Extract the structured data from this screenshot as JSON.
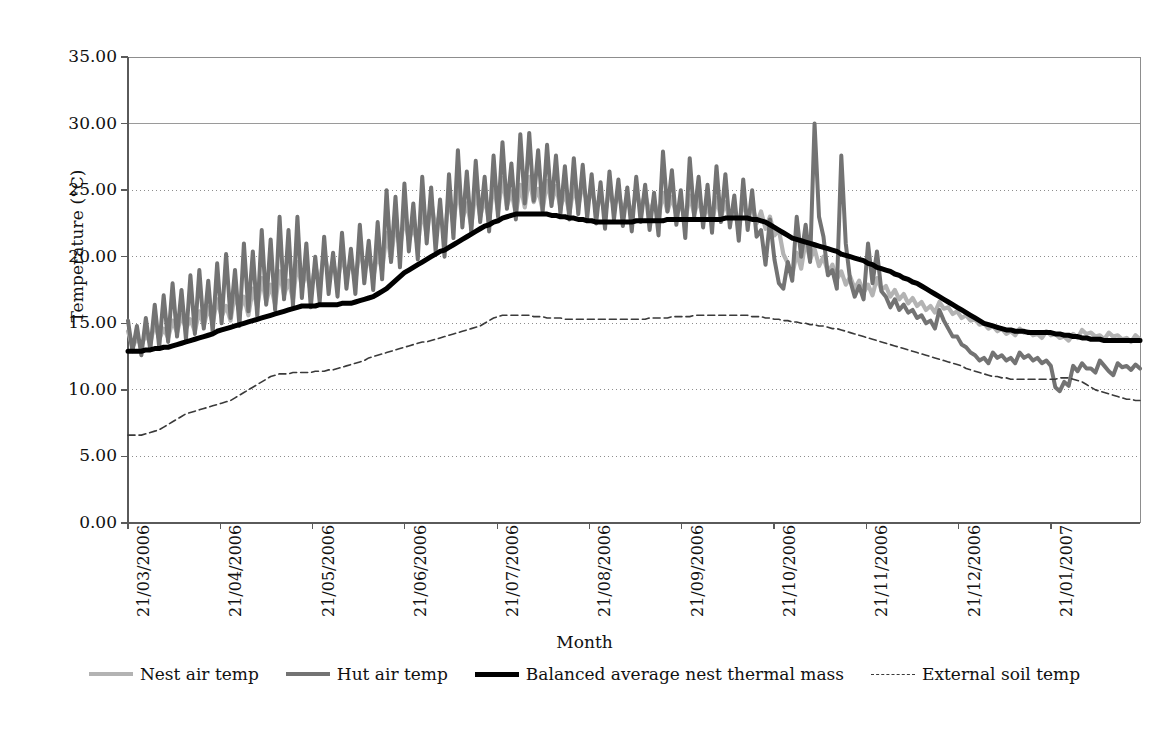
{
  "figure": {
    "cropped_caption_fragment": "",
    "background": "#ffffff"
  },
  "axes": {
    "y_title": "Temperature (°C)",
    "x_title": "Month",
    "y_ticks": [
      "0.00",
      "5.00",
      "10.00",
      "15.00",
      "20.00",
      "25.00",
      "30.00",
      "35.00"
    ],
    "x_ticks": [
      "21/03/2006",
      "21/04/2006",
      "21/05/2006",
      "21/06/2006",
      "21/07/2006",
      "21/08/2006",
      "21/09/2006",
      "21/10/2006",
      "21/11/2006",
      "21/12/2006",
      "21/01/2007"
    ]
  },
  "legend": {
    "position": "bottom",
    "items": [
      {
        "label": "Nest air temp",
        "color": "#b3b3b3",
        "style": "solid",
        "width": 4
      },
      {
        "label": "Hut air temp",
        "color": "#737373",
        "style": "solid",
        "width": 4
      },
      {
        "label": "Balanced average nest thermal mass",
        "color": "#000000",
        "style": "solid",
        "width": 5
      },
      {
        "label": "External soil temp",
        "color": "#3a3a3a",
        "style": "dashed",
        "width": 1.4
      }
    ]
  },
  "chart_data": {
    "type": "line",
    "title": "",
    "xlabel": "Month",
    "ylabel": "Temperature (°C)",
    "ylim": [
      0,
      35
    ],
    "ytick_step": 5,
    "grid": "horizontal-dotted",
    "x_start": "21/03/2006",
    "x_end": "21/02/2007",
    "x_tick_labels": [
      "21/03/2006",
      "21/04/2006",
      "21/05/2006",
      "21/06/2006",
      "21/07/2006",
      "21/08/2006",
      "21/09/2006",
      "21/10/2006",
      "21/11/2006",
      "21/12/2006",
      "21/01/2007"
    ],
    "x_tick_positions_frac": [
      0.0,
      0.0912,
      0.1824,
      0.2736,
      0.3648,
      0.456,
      0.5472,
      0.6384,
      0.7296,
      0.8208,
      0.912
    ],
    "series": [
      {
        "name": "Nest air temp",
        "color": "#b3b3b3",
        "style": "solid",
        "values": [
          14.4,
          13.2,
          13.9,
          13.3,
          14.2,
          13.5,
          15.0,
          13.8,
          14.6,
          13.9,
          15.2,
          14.3,
          15.6,
          14.6,
          15.3,
          14.4,
          15.9,
          14.8,
          16.2,
          15.0,
          16.8,
          15.5,
          16.3,
          15.2,
          17.3,
          15.8,
          17.0,
          15.6,
          17.6,
          16.2,
          18.4,
          16.6,
          17.9,
          16.4,
          18.9,
          17.1,
          18.2,
          16.8,
          19.6,
          17.7,
          18.9,
          17.4,
          19.3,
          17.9,
          20.4,
          18.6,
          19.6,
          18.1,
          20.1,
          18.5,
          19.7,
          18.2,
          20.6,
          19.0,
          19.9,
          18.4,
          20.3,
          18.9,
          21.8,
          19.8,
          22.6,
          20.6,
          23.0,
          21.2,
          22.3,
          20.8,
          23.6,
          21.6,
          24.2,
          22.1,
          23.3,
          21.5,
          24.6,
          22.4,
          25.2,
          22.8,
          24.0,
          22.3,
          25.0,
          23.0,
          24.4,
          22.7,
          25.5,
          23.4,
          25.9,
          23.8,
          24.9,
          23.2,
          25.4,
          23.7,
          26.0,
          24.1,
          25.1,
          23.5,
          25.7,
          24.0,
          25.3,
          23.7,
          24.8,
          23.3,
          25.2,
          23.8,
          25.5,
          24.0,
          25.0,
          23.6,
          24.6,
          23.2,
          25.1,
          23.7,
          24.8,
          23.4,
          24.4,
          23.0,
          25.0,
          23.6,
          24.7,
          23.3,
          24.2,
          22.9,
          24.8,
          23.4,
          24.5,
          23.1,
          24.0,
          22.7,
          24.6,
          23.2,
          24.3,
          22.9,
          23.8,
          22.5,
          24.4,
          23.0,
          24.1,
          22.7,
          23.6,
          22.3,
          24.2,
          22.8,
          23.9,
          22.5,
          23.4,
          22.1,
          23.0,
          21.6,
          22.0,
          20.2,
          19.5,
          18.6,
          20.3,
          19.1,
          21.2,
          19.8,
          20.6,
          19.3,
          20.0,
          18.8,
          19.4,
          18.3,
          18.9,
          17.9,
          18.5,
          17.6,
          18.2,
          17.3,
          17.9,
          17.1,
          18.4,
          17.5,
          17.8,
          17.0,
          17.5,
          16.8,
          17.2,
          16.5,
          16.9,
          16.3,
          16.6,
          16.0,
          16.3,
          15.8,
          16.6,
          16.1,
          16.2,
          15.7,
          15.9,
          15.4,
          15.6,
          15.2,
          15.3,
          14.9,
          15.0,
          14.6,
          14.8,
          14.4,
          14.6,
          14.2,
          14.4,
          14.1,
          14.6,
          14.3,
          14.4,
          14.1,
          14.2,
          13.9,
          14.4,
          14.1,
          14.2,
          13.9,
          14.0,
          13.7,
          14.2,
          13.9,
          14.5,
          14.2,
          14.3,
          14.0,
          14.1,
          13.8,
          14.3,
          14.0,
          14.1,
          13.8,
          13.9,
          13.6,
          14.1,
          13.8
        ]
      },
      {
        "name": "Hut air temp",
        "color": "#737373",
        "style": "solid",
        "values": [
          15.2,
          12.9,
          14.8,
          12.6,
          15.4,
          13.0,
          16.4,
          13.2,
          17.1,
          13.6,
          18.0,
          14.0,
          17.5,
          13.8,
          18.6,
          14.2,
          19.0,
          14.6,
          18.2,
          14.3,
          19.5,
          15.0,
          20.2,
          15.4,
          19.0,
          14.8,
          21.0,
          15.9,
          20.4,
          15.5,
          22.0,
          16.4,
          21.3,
          16.0,
          23.0,
          16.8,
          22.0,
          16.3,
          23.0,
          16.9,
          21.0,
          16.2,
          20.0,
          16.6,
          21.5,
          17.2,
          20.3,
          17.0,
          21.8,
          17.6,
          20.6,
          17.2,
          22.4,
          18.0,
          21.2,
          17.5,
          22.6,
          18.3,
          25.0,
          19.6,
          24.5,
          19.2,
          25.5,
          20.4,
          24.0,
          19.8,
          26.0,
          21.0,
          25.2,
          20.4,
          24.3,
          20.0,
          26.2,
          21.4,
          28.0,
          22.2,
          26.4,
          21.8,
          27.2,
          22.6,
          26.0,
          21.9,
          27.6,
          23.0,
          28.6,
          23.6,
          27.0,
          22.8,
          29.2,
          24.0,
          29.3,
          24.2,
          28.0,
          23.4,
          28.4,
          23.8,
          27.6,
          23.2,
          26.8,
          22.8,
          27.4,
          23.2,
          26.9,
          22.9,
          26.2,
          22.5,
          25.6,
          22.1,
          26.4,
          22.8,
          25.8,
          22.3,
          25.2,
          21.9,
          26.0,
          22.6,
          25.4,
          22.0,
          24.8,
          21.6,
          27.9,
          23.4,
          26.5,
          22.4,
          25.0,
          21.4,
          27.4,
          23.0,
          26.0,
          22.2,
          25.4,
          21.8,
          26.8,
          22.6,
          26.2,
          22.2,
          24.6,
          21.2,
          25.8,
          22.0,
          25.0,
          21.5,
          22.0,
          19.4,
          22.8,
          19.8,
          18.0,
          17.6,
          19.6,
          18.2,
          23.0,
          20.0,
          22.4,
          19.6,
          30.0,
          23.0,
          21.5,
          18.6,
          19.0,
          17.6,
          27.6,
          21.0,
          18.2,
          17.0,
          17.8,
          16.8,
          21.0,
          18.0,
          20.4,
          17.4,
          17.0,
          16.2,
          16.8,
          16.0,
          16.4,
          15.8,
          16.0,
          15.4,
          15.6,
          15.0,
          15.2,
          14.6,
          16.0,
          15.2,
          14.6,
          14.0,
          14.0,
          13.4,
          13.2,
          12.8,
          12.6,
          12.2,
          12.4,
          12.0,
          12.8,
          12.4,
          12.6,
          12.2,
          12.4,
          12.0,
          12.8,
          12.4,
          12.6,
          12.2,
          12.4,
          12.0,
          12.2,
          11.8,
          10.2,
          9.9,
          10.6,
          10.3,
          11.8,
          11.4,
          12.0,
          11.6,
          11.6,
          11.3,
          12.2,
          11.8,
          11.4,
          11.1,
          12.0,
          11.7,
          11.8,
          11.5,
          11.9,
          11.6
        ]
      },
      {
        "name": "Balanced average nest thermal mass",
        "color": "#000000",
        "style": "solid",
        "values": [
          12.9,
          12.9,
          12.9,
          12.9,
          13.0,
          13.0,
          13.1,
          13.1,
          13.2,
          13.2,
          13.3,
          13.4,
          13.5,
          13.6,
          13.7,
          13.8,
          13.9,
          14.0,
          14.1,
          14.2,
          14.4,
          14.5,
          14.6,
          14.7,
          14.8,
          14.9,
          15.0,
          15.1,
          15.2,
          15.3,
          15.4,
          15.5,
          15.6,
          15.7,
          15.8,
          15.9,
          16.0,
          16.1,
          16.2,
          16.3,
          16.3,
          16.3,
          16.3,
          16.4,
          16.4,
          16.4,
          16.4,
          16.4,
          16.5,
          16.5,
          16.5,
          16.6,
          16.7,
          16.8,
          16.9,
          17.0,
          17.2,
          17.4,
          17.6,
          17.9,
          18.2,
          18.5,
          18.8,
          19.0,
          19.2,
          19.4,
          19.6,
          19.8,
          20.0,
          20.2,
          20.4,
          20.5,
          20.7,
          20.9,
          21.1,
          21.3,
          21.5,
          21.7,
          21.9,
          22.1,
          22.3,
          22.4,
          22.6,
          22.7,
          22.9,
          23.0,
          23.1,
          23.2,
          23.2,
          23.2,
          23.2,
          23.2,
          23.2,
          23.2,
          23.2,
          23.1,
          23.1,
          23.0,
          23.0,
          22.9,
          22.9,
          22.8,
          22.8,
          22.7,
          22.7,
          22.6,
          22.6,
          22.6,
          22.6,
          22.6,
          22.6,
          22.6,
          22.6,
          22.6,
          22.7,
          22.7,
          22.7,
          22.7,
          22.7,
          22.7,
          22.7,
          22.8,
          22.8,
          22.8,
          22.8,
          22.8,
          22.8,
          22.8,
          22.8,
          22.8,
          22.8,
          22.8,
          22.8,
          22.8,
          22.9,
          22.9,
          22.9,
          22.9,
          22.9,
          22.9,
          22.8,
          22.8,
          22.7,
          22.6,
          22.4,
          22.2,
          22.0,
          21.8,
          21.6,
          21.4,
          21.3,
          21.2,
          21.1,
          21.0,
          20.9,
          20.8,
          20.7,
          20.6,
          20.5,
          20.4,
          20.2,
          20.1,
          20.0,
          19.9,
          19.8,
          19.7,
          19.5,
          19.4,
          19.2,
          19.1,
          19.0,
          18.9,
          18.7,
          18.6,
          18.4,
          18.3,
          18.1,
          18.0,
          17.8,
          17.6,
          17.4,
          17.2,
          17.0,
          16.8,
          16.6,
          16.4,
          16.2,
          16.0,
          15.8,
          15.6,
          15.4,
          15.2,
          15.0,
          14.9,
          14.8,
          14.7,
          14.6,
          14.5,
          14.5,
          14.4,
          14.4,
          14.4,
          14.3,
          14.3,
          14.3,
          14.3,
          14.3,
          14.3,
          14.2,
          14.2,
          14.1,
          14.1,
          14.0,
          14.0,
          13.9,
          13.9,
          13.8,
          13.8,
          13.8,
          13.7,
          13.7,
          13.7,
          13.7,
          13.7,
          13.7,
          13.7,
          13.7,
          13.7
        ]
      },
      {
        "name": "External soil temp",
        "color": "#3a3a3a",
        "style": "dashed",
        "values": [
          6.6,
          6.6,
          6.6,
          6.6,
          6.7,
          6.8,
          6.9,
          7.0,
          7.2,
          7.4,
          7.6,
          7.8,
          8.0,
          8.2,
          8.3,
          8.4,
          8.5,
          8.6,
          8.7,
          8.8,
          8.9,
          9.0,
          9.1,
          9.2,
          9.4,
          9.6,
          9.8,
          10.0,
          10.2,
          10.4,
          10.6,
          10.8,
          11.0,
          11.1,
          11.2,
          11.2,
          11.2,
          11.3,
          11.3,
          11.3,
          11.3,
          11.3,
          11.4,
          11.4,
          11.4,
          11.5,
          11.5,
          11.6,
          11.7,
          11.8,
          11.9,
          12.0,
          12.1,
          12.2,
          12.4,
          12.5,
          12.6,
          12.7,
          12.8,
          12.9,
          13.0,
          13.1,
          13.2,
          13.3,
          13.4,
          13.5,
          13.6,
          13.6,
          13.7,
          13.8,
          13.9,
          14.0,
          14.1,
          14.2,
          14.3,
          14.4,
          14.5,
          14.6,
          14.7,
          14.8,
          15.0,
          15.2,
          15.4,
          15.5,
          15.6,
          15.6,
          15.6,
          15.6,
          15.6,
          15.6,
          15.6,
          15.5,
          15.5,
          15.5,
          15.4,
          15.4,
          15.4,
          15.4,
          15.3,
          15.3,
          15.3,
          15.3,
          15.3,
          15.3,
          15.3,
          15.3,
          15.3,
          15.3,
          15.3,
          15.3,
          15.3,
          15.3,
          15.3,
          15.3,
          15.3,
          15.3,
          15.3,
          15.4,
          15.4,
          15.4,
          15.4,
          15.4,
          15.5,
          15.5,
          15.5,
          15.5,
          15.5,
          15.6,
          15.6,
          15.6,
          15.6,
          15.6,
          15.6,
          15.6,
          15.6,
          15.6,
          15.6,
          15.6,
          15.6,
          15.6,
          15.5,
          15.5,
          15.5,
          15.4,
          15.4,
          15.3,
          15.3,
          15.2,
          15.2,
          15.1,
          15.1,
          15.0,
          15.0,
          14.9,
          14.9,
          14.8,
          14.8,
          14.7,
          14.6,
          14.6,
          14.5,
          14.4,
          14.3,
          14.2,
          14.1,
          14.0,
          13.9,
          13.8,
          13.7,
          13.6,
          13.5,
          13.4,
          13.3,
          13.2,
          13.1,
          13.0,
          12.9,
          12.8,
          12.7,
          12.6,
          12.5,
          12.4,
          12.3,
          12.2,
          12.1,
          12.0,
          11.9,
          11.8,
          11.6,
          11.5,
          11.4,
          11.3,
          11.2,
          11.1,
          11.0,
          11.0,
          10.9,
          10.9,
          10.8,
          10.8,
          10.8,
          10.8,
          10.8,
          10.8,
          10.8,
          10.8,
          10.8,
          10.8,
          10.8,
          10.9,
          10.9,
          10.9,
          10.8,
          10.7,
          10.6,
          10.4,
          10.2,
          10.0,
          9.9,
          9.8,
          9.7,
          9.6,
          9.5,
          9.4,
          9.3,
          9.3,
          9.2,
          9.2
        ]
      }
    ]
  }
}
